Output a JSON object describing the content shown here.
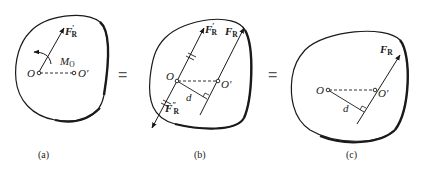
{
  "panels": [
    {
      "id": "a",
      "caption": "(a)",
      "labels": {
        "force": "F",
        "force_sub": "R",
        "force_prime": "′",
        "moment": "M",
        "moment_sub": "O",
        "point_o": "O",
        "point_o_prime": "O′"
      }
    },
    {
      "id": "b",
      "caption": "(b)",
      "labels": {
        "force1": "F",
        "force1_sub": "R",
        "force1_prime": "′",
        "force2": "F",
        "force2_sub": "R",
        "force3": "F",
        "force3_sub": "R",
        "force3_prime": "″",
        "point_o": "O",
        "point_o_prime": "O′",
        "distance": "d"
      }
    },
    {
      "id": "c",
      "caption": "(c)",
      "labels": {
        "force": "F",
        "force_sub": "R",
        "point_o": "O",
        "point_o_prime": "O′",
        "distance": "d"
      }
    }
  ],
  "equals": [
    "=",
    "="
  ],
  "colors": {
    "stroke": "#1a1a1a",
    "background": "#ffffff"
  }
}
